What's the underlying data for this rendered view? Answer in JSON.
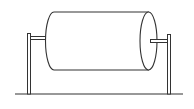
{
  "diagram": {
    "stroke_color": "#333333",
    "background": "#ffffff",
    "ground": {
      "x1": 15,
      "x2": 183,
      "y": 94
    },
    "left_post": {
      "x": 27,
      "y": 33,
      "width": 4,
      "height": 61
    },
    "right_post": {
      "x": 167,
      "y": 34,
      "width": 4,
      "height": 60
    },
    "left_axle": {
      "x": 31,
      "y": 36,
      "width": 15,
      "height": 3
    },
    "right_axle": {
      "x": 151,
      "y": 39,
      "width": 17,
      "height": 3
    },
    "cylinder": {
      "top_y": 12,
      "bottom_y": 70,
      "left_x": 52,
      "right_x": 149,
      "end_rx": 8.5,
      "end_ry": 29
    }
  }
}
